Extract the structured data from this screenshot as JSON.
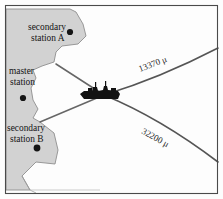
{
  "figure": {
    "name": "hyperbolic-navigation-chart",
    "frame": {
      "border_color": "#4a4a4a",
      "background_color": "#fdfdfd"
    },
    "land": {
      "name": "landmass",
      "fill_color": "#d2d2d2",
      "stroke_color": "#8a8a8a"
    },
    "stations": [
      {
        "id": "secondary-a",
        "line1": "secondary",
        "line2": "station A",
        "dot_color": "#151515"
      },
      {
        "id": "master",
        "line1": "master",
        "line2": "station",
        "dot_color": "#151515"
      },
      {
        "id": "secondary-b",
        "line1": "secondary",
        "line2": "station B",
        "dot_color": "#151515"
      }
    ],
    "vessel": {
      "name": "ship-icon",
      "color": "#121212"
    },
    "lop_lines": [
      {
        "id": "lop-upper",
        "label": "13370 μ",
        "color": "#555555"
      },
      {
        "id": "lop-lower",
        "label": "32200 μ",
        "color": "#555555"
      }
    ],
    "baselines": [
      {
        "id": "baseline-a",
        "color": "#666666"
      },
      {
        "id": "baseline-b",
        "color": "#666666"
      }
    ]
  }
}
